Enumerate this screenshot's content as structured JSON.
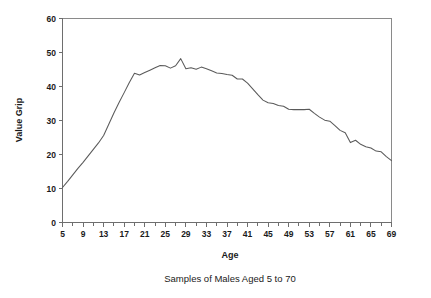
{
  "chart_data": {
    "type": "line",
    "title": "",
    "caption": "Samples of Males Aged 5 to 70",
    "xlabel": "Age",
    "ylabel": "Value Grip",
    "xlim": [
      5,
      69
    ],
    "ylim": [
      0,
      60
    ],
    "grid": false,
    "legend": null,
    "x_tick_labels": [
      "5",
      "9",
      "13",
      "17",
      "21",
      "25",
      "29",
      "33",
      "37",
      "41",
      "45",
      "49",
      "53",
      "57",
      "61",
      "65",
      "69"
    ],
    "x_tick_values": [
      5,
      9,
      13,
      17,
      21,
      25,
      29,
      33,
      37,
      41,
      45,
      49,
      53,
      57,
      61,
      65,
      69
    ],
    "x_minor_tick_values": [
      7,
      11,
      15,
      19,
      23,
      27,
      31,
      35,
      39,
      43,
      47,
      51,
      55,
      59,
      63,
      67
    ],
    "y_tick_labels": [
      "0",
      "10",
      "20",
      "30",
      "40",
      "50",
      "60"
    ],
    "y_tick_values": [
      0,
      10,
      20,
      30,
      40,
      50,
      60
    ],
    "series": [
      {
        "name": "Grip strength",
        "color": "#5a5a5a",
        "x": [
          5,
          6,
          7,
          8,
          9,
          10,
          11,
          12,
          13,
          14,
          15,
          16,
          17,
          18,
          19,
          20,
          21,
          22,
          23,
          24,
          25,
          26,
          27,
          28,
          29,
          30,
          31,
          32,
          33,
          34,
          35,
          36,
          37,
          38,
          39,
          40,
          41,
          42,
          43,
          44,
          45,
          46,
          47,
          48,
          49,
          50,
          51,
          52,
          53,
          54,
          55,
          56,
          57,
          58,
          59,
          60,
          61,
          62,
          63,
          64,
          65,
          66,
          67,
          68,
          69
        ],
        "values": [
          10.3,
          12.1,
          14.0,
          15.9,
          17.7,
          19.6,
          21.5,
          23.4,
          25.6,
          28.9,
          32.2,
          35.3,
          38.2,
          41.2,
          43.9,
          43.4,
          44.1,
          44.8,
          45.5,
          46.2,
          46.1,
          45.4,
          46.1,
          48.2,
          45.2,
          45.5,
          45.1,
          45.7,
          45.2,
          44.6,
          44.0,
          43.8,
          43.5,
          43.3,
          42.2,
          42.2,
          41.0,
          39.3,
          37.6,
          36.0,
          35.2,
          35.0,
          34.4,
          34.2,
          33.3,
          33.2,
          33.2,
          33.2,
          33.3,
          32.1,
          31.0,
          30.1,
          29.8,
          28.5,
          27.1,
          26.4,
          23.5,
          24.2,
          23.0,
          22.3,
          21.9,
          21.0,
          20.8,
          19.4,
          18.2
        ]
      }
    ]
  }
}
